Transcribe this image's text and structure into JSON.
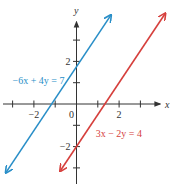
{
  "chart_data": {
    "type": "line",
    "title": "",
    "xlabel": "x",
    "ylabel": "y",
    "xlim": [
      -3.3,
      4.0
    ],
    "ylim": [
      -3.5,
      4.0
    ],
    "grid": false,
    "x_ticks": [
      -3,
      -2,
      -1,
      0,
      1,
      2,
      3
    ],
    "y_ticks": [
      -3,
      -2,
      -1,
      1,
      2,
      3
    ],
    "x_tick_labels": [
      {
        "value": -2,
        "text": "−2"
      },
      {
        "value": 0,
        "text": "0"
      },
      {
        "value": 2,
        "text": "2"
      }
    ],
    "y_tick_labels": [
      {
        "value": 2,
        "text": "2"
      },
      {
        "value": -2,
        "text": "−2"
      }
    ],
    "series": [
      {
        "name": "−6x + 4y = 7",
        "equation": "-6x + 4y = 7",
        "slope": 1.5,
        "intercept": 1.75,
        "color": "#2a8fc8",
        "x_range": [
          -3.3,
          1.6
        ],
        "label": "−6x + 4y = 7",
        "label_anchor": {
          "x": -3.0,
          "y": 0.95
        }
      },
      {
        "name": "3x − 2y = 4",
        "equation": "3x - 2y = 4",
        "slope": 1.5,
        "intercept": -2.0,
        "color": "#d6403d",
        "x_range": [
          -0.75,
          4.15
        ],
        "label": "3x − 2y = 4",
        "label_anchor": {
          "x": 0.9,
          "y": -1.55
        }
      }
    ],
    "annotations": [],
    "legend": "none"
  },
  "axis_color": "#333333"
}
